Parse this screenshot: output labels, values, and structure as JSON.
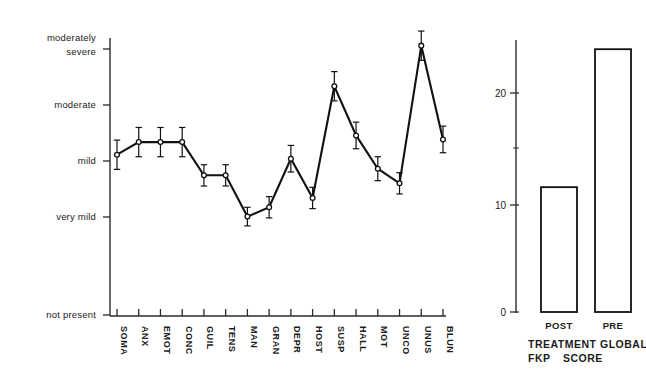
{
  "chart_data": [
    {
      "type": "line",
      "panel": "left",
      "title": "",
      "xlabel": "",
      "ylabel": "",
      "categories": [
        "SOMA",
        "ANX",
        "EMOT",
        "CONC",
        "GUIL",
        "TENS",
        "MAN",
        "GRAN",
        "DEPR",
        "HOST",
        "SUSP",
        "HALL",
        "MOT",
        "UNCO",
        "UNUS",
        "BLUN"
      ],
      "ytick_labels": [
        "not present",
        "very mild",
        "mild",
        "moderate",
        "moderately severe"
      ],
      "ytick_values": [
        0,
        1,
        2,
        3,
        4
      ],
      "ylim": [
        0,
        4.6
      ],
      "grid": false,
      "legend": null,
      "values": [
        2.41,
        2.6,
        2.6,
        2.6,
        2.1,
        2.1,
        1.48,
        1.62,
        2.35,
        1.76,
        3.44,
        2.7,
        2.2,
        1.98,
        4.05,
        2.64
      ],
      "errors": [
        0.22,
        0.22,
        0.22,
        0.22,
        0.16,
        0.16,
        0.14,
        0.16,
        0.2,
        0.16,
        0.22,
        0.2,
        0.18,
        0.16,
        0.22,
        0.2
      ],
      "marker": "open-circle",
      "error_bars": true
    },
    {
      "type": "bar",
      "panel": "right",
      "title": "",
      "categories": [
        "POST",
        "PRE"
      ],
      "values": [
        11.4,
        24.0
      ],
      "ylim": [
        0,
        26
      ],
      "ytick_labels": [
        "0",
        "10",
        "20"
      ],
      "ytick_values": [
        0,
        10,
        20
      ],
      "minor_ticks": [
        5,
        15,
        25
      ],
      "grid": false,
      "xlabel_lines": [
        "TREATMENT GLOBAL",
        "FKP    SCORE"
      ],
      "caption_left": "TREATMENT",
      "caption_left2": "FKP",
      "caption_right": "GLOBAL",
      "caption_right2": "SCORE"
    }
  ],
  "left_panel": {
    "y_labels": [
      {
        "text1": "moderately",
        "text2": "severe"
      },
      {
        "text1": "moderate",
        "text2": ""
      },
      {
        "text1": "mild",
        "text2": ""
      },
      {
        "text1": "very mild",
        "text2": ""
      },
      {
        "text1": "not present",
        "text2": ""
      }
    ],
    "x_labels": [
      "SOMA",
      "ANX",
      "EMOT",
      "CONC",
      "GUIL",
      "TENS",
      "MAN",
      "GRAN",
      "DEPR",
      "HOST",
      "SUSP",
      "HALL",
      "MOT",
      "UNCO",
      "UNUS",
      "BLUN"
    ]
  },
  "right_panel": {
    "y_labels": [
      "20",
      "10",
      "0"
    ],
    "bar_labels": [
      "POST",
      "PRE"
    ],
    "caption": {
      "line1_a": "TREATMENT",
      "line1_b": "GLOBAL",
      "line2_a": "FKP",
      "line2_b": "SCORE"
    }
  },
  "colors": {
    "ink": "#1a1a1a",
    "line": "#111111",
    "background": "#ffffff"
  }
}
